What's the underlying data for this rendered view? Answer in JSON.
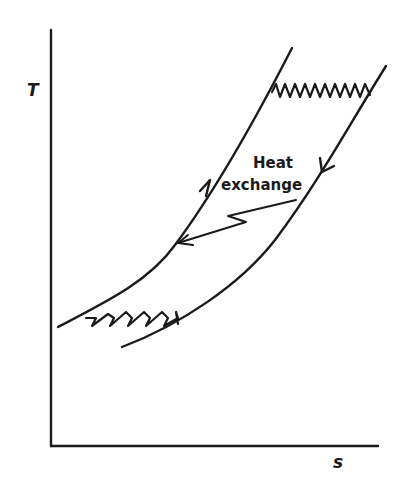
{
  "diagram": {
    "type": "T-s diagram",
    "axes": {
      "y_label": "T",
      "x_label": "s"
    },
    "annotation": {
      "line1": "Heat",
      "line2": "exchange"
    },
    "elements": [
      {
        "name": "left-process-curve",
        "direction": "up"
      },
      {
        "name": "right-process-curve",
        "direction": "down"
      },
      {
        "name": "top-heat-addition-zigzag"
      },
      {
        "name": "bottom-heat-rejection-zigzag"
      },
      {
        "name": "heat-exchange-arrow"
      }
    ],
    "colors": {
      "ink": "#1a1a1a",
      "background": "#ffffff"
    }
  }
}
